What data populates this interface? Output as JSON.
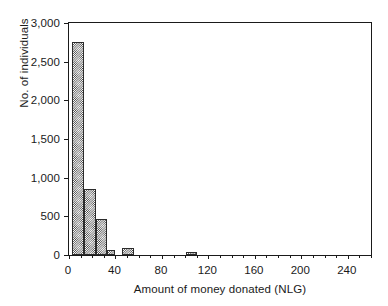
{
  "chart_data": {
    "type": "bar",
    "title": "",
    "subtitle": "",
    "xlabel": "Amount of money donated (NLG)",
    "ylabel": "No. of individuals",
    "xlim": [
      0,
      260
    ],
    "ylim": [
      0,
      3000
    ],
    "grid": false,
    "legend": null,
    "xticks": [
      0,
      40,
      80,
      120,
      160,
      200,
      240
    ],
    "xtick_labels": [
      "0",
      "40",
      "80",
      "120",
      "160",
      "200",
      "240"
    ],
    "x_minor_tick_interval": 10,
    "yticks": [
      0,
      500,
      1000,
      1500,
      2000,
      2500,
      3000
    ],
    "ytick_labels": [
      "0",
      "500",
      "1,000",
      "1,500",
      "2,000",
      "2,500",
      "3,000"
    ],
    "bin_width": 10,
    "bins": [
      {
        "x_start": 3,
        "x_end": 13,
        "value": 2760
      },
      {
        "x_start": 13,
        "x_end": 23,
        "value": 850
      },
      {
        "x_start": 23,
        "x_end": 33,
        "value": 470
      },
      {
        "x_start": 33,
        "x_end": 40,
        "value": 60
      },
      {
        "x_start": 46,
        "x_end": 56,
        "value": 85
      },
      {
        "x_start": 101,
        "x_end": 110,
        "value": 45
      }
    ],
    "categories": [
      "0-10",
      "10-20",
      "20-30",
      "30-40",
      "45-55",
      "100-110"
    ],
    "values": [
      2760,
      850,
      470,
      60,
      85,
      45
    ],
    "series": [
      {
        "name": "No. of individuals",
        "values": [
          2760,
          850,
          470,
          60,
          85,
          45
        ]
      }
    ],
    "colors": {
      "bar_fill": "#3a3a3a",
      "bar_background": "#ffffff",
      "bar_edge": "#2b2b2b",
      "axis": "#1a1a1a",
      "text": "#1a1a1a",
      "plot_background": "#ffffff"
    }
  }
}
